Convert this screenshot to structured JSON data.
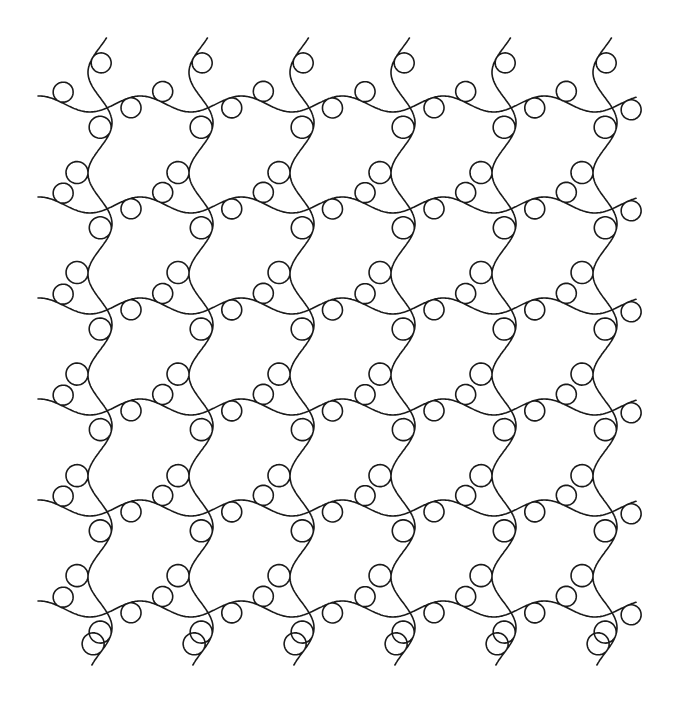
{
  "pattern": {
    "name": "loop-grid-quilting-pattern",
    "vertical_strands": 6,
    "horizontal_strands": 6,
    "loops_per_vertical_segment": 2,
    "loops_per_horizontal_segment": 2,
    "stroke_color": "#1a1a1a",
    "background_color": "#ffffff"
  }
}
